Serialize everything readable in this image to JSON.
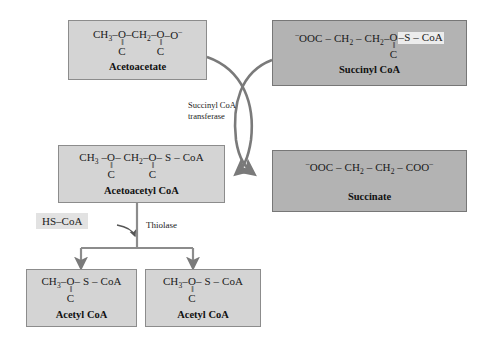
{
  "diagram": {
    "colors": {
      "box_light": "#d4d4d4",
      "box_dark": "#b3b3b3",
      "border": "#8c8c8c",
      "arrow": "#7a7a7a",
      "highlight": "#ececec",
      "background": "#ffffff"
    }
  },
  "compounds": {
    "acetoacetate": {
      "name": "Acetoacetate",
      "f1": "CH",
      "f1sub": "3",
      "dash1": "–",
      "c1_oxygen": "O",
      "c1_double": "‖",
      "c1_atom": "C",
      "dash2": "–",
      "f2": "CH",
      "f2sub": "2",
      "dash3": "–",
      "c2_oxygen": "O",
      "c2_double": "‖",
      "c2_atom": "C",
      "dash4": "–",
      "tail": "O",
      "tail_charge": "–"
    },
    "succinyl_coa": {
      "name": "Succinyl CoA",
      "lead_charge": "–",
      "lead": "OOC",
      "dash1": "–",
      "f1": "CH",
      "f1sub": "2",
      "dash2": "–",
      "f2": "CH",
      "f2sub": "2",
      "dash3": "–",
      "c_oxygen": "O",
      "c_double": "‖",
      "c_atom": "C",
      "dash4": "–",
      "thio": "S",
      "dash5": "–",
      "coa": "CoA"
    },
    "acetoacetyl_coa": {
      "name": "Acetoacetyl CoA",
      "f1": "CH",
      "f1sub": "3",
      "dash1": "–",
      "c1_oxygen": "O",
      "c1_double": "‖",
      "c1_atom": "C",
      "dash2": "–",
      "f2": "CH",
      "f2sub": "2",
      "dash3": "–",
      "c2_oxygen": "O",
      "c2_double": "‖",
      "c2_atom": "C",
      "dash4": "–",
      "thio": "S",
      "dash5": "–",
      "coa": "CoA"
    },
    "succinate": {
      "name": "Succinate",
      "lead_charge": "–",
      "lead": "OOC",
      "dash1": "–",
      "f1": "CH",
      "f1sub": "2",
      "dash2": "–",
      "f2": "CH",
      "f2sub": "2",
      "dash3": "–",
      "tail": "COO",
      "tail_charge": "–"
    },
    "acetyl_coa_left": {
      "name": "Acetyl CoA",
      "f1": "CH",
      "f1sub": "3",
      "dash1": "–",
      "c_oxygen": "O",
      "c_double": "‖",
      "c_atom": "C",
      "dash2": "–",
      "thio": "S",
      "dash3": "–",
      "coa": "CoA"
    },
    "acetyl_coa_right": {
      "name": "Acetyl CoA",
      "f1": "CH",
      "f1sub": "3",
      "dash1": "–",
      "c_oxygen": "O",
      "c_double": "‖",
      "c_atom": "C",
      "dash2": "–",
      "thio": "S",
      "dash3": "–",
      "coa": "CoA"
    }
  },
  "enzymes": {
    "transferase_line1": "Succinyl CoA",
    "transferase_line2": "transferase",
    "thiolase": "Thiolase"
  },
  "cofactors": {
    "hs_coa_left": "HS",
    "hs_coa_dash": "–",
    "hs_coa_right": "CoA"
  }
}
